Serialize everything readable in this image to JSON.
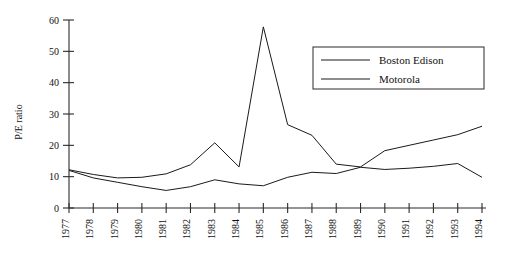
{
  "chart_data": {
    "type": "line",
    "title": "",
    "subtitle": "",
    "xlabel": "",
    "ylabel": "P/E ratio",
    "categories": [
      "1977",
      "1978",
      "1979",
      "1980",
      "1981",
      "1982",
      "1983",
      "1984",
      "1985",
      "1986",
      "1987",
      "1988",
      "1989",
      "1990",
      "1991",
      "1992",
      "1993",
      "1994"
    ],
    "x": [
      1977,
      1978,
      1979,
      1980,
      1981,
      1982,
      1983,
      1984,
      1985,
      1986,
      1987,
      1988,
      1989,
      1990,
      1991,
      1992,
      1993,
      1994
    ],
    "xlim": [
      1977,
      1994
    ],
    "ylim": [
      0,
      60
    ],
    "yticks": [
      0,
      10,
      20,
      30,
      40,
      50,
      60
    ],
    "ytick_labels": [
      "0",
      "10",
      "20",
      "30",
      "40",
      "50",
      "60"
    ],
    "grid": false,
    "legend_position": "upper-right",
    "series": [
      {
        "name": "Boston Edison",
        "color": "#1a1a1a",
        "values": [
          12.0,
          9.6,
          8.2,
          6.8,
          5.6,
          6.8,
          9.0,
          7.7,
          7.1,
          9.8,
          11.4,
          11.0,
          13.0,
          12.3,
          12.7,
          13.3,
          14.2,
          9.8
        ]
      },
      {
        "name": "Motorola",
        "color": "#1a1a1a",
        "values": [
          12.2,
          10.7,
          9.6,
          9.8,
          10.9,
          13.8,
          20.8,
          13.1,
          57.8,
          26.6,
          23.2,
          14.0,
          13.1,
          18.3,
          20.0,
          21.7,
          23.4,
          26.1
        ]
      }
    ]
  },
  "legend": {
    "entries": [
      {
        "label": "Boston Edison"
      },
      {
        "label": "Motorola"
      }
    ]
  }
}
